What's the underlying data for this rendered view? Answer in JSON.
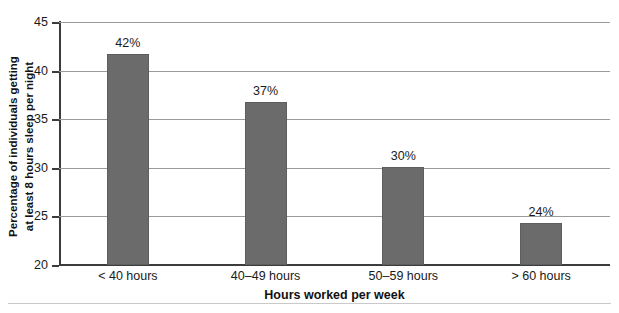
{
  "chart_data": {
    "type": "bar",
    "title": "",
    "subtitle": "",
    "categories": [
      "< 40 hours",
      "40–49 hours",
      "50–59 hours",
      "> 60 hours"
    ],
    "values": [
      41.7,
      36.8,
      30.1,
      24.3
    ],
    "data_labels": [
      "42%",
      "37%",
      "30%",
      "24%"
    ],
    "series": [
      {
        "name": "Percentage of individuals getting at least 8 hours sleep per night",
        "values": [
          41.7,
          36.8,
          30.1,
          24.3
        ]
      }
    ],
    "xlabel": "Hours worked per week",
    "ylabel_line1": "Percentage of individuals getting",
    "ylabel_line2": "at least 8 hours sleep per night",
    "ylim": [
      20,
      45
    ],
    "yticks": [
      "20",
      "25",
      "30",
      "35",
      "40",
      "45"
    ],
    "ytick_values": [
      20,
      25,
      30,
      35,
      40,
      45
    ],
    "grid": "horizontal",
    "legend": "none",
    "bar_color": "#6b6b6b",
    "grid_color": "#9a9a9a",
    "axis_color": "#3c3c3c",
    "background": "#ffffff"
  }
}
